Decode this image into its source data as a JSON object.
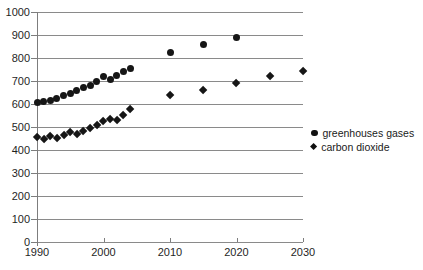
{
  "chart_data": {
    "type": "scatter",
    "title": "",
    "xlabel": "",
    "ylabel": "",
    "xlim": [
      1990,
      2030
    ],
    "ylim": [
      0,
      1000
    ],
    "grid": true,
    "legend_position": "right-middle",
    "x_ticks": [
      1990,
      2000,
      2010,
      2020,
      2030
    ],
    "y_ticks": [
      0,
      100,
      200,
      300,
      400,
      500,
      600,
      700,
      800,
      900,
      1000
    ],
    "series": [
      {
        "name": "greenhouses gases",
        "marker": "circle",
        "points": [
          [
            1990,
            605
          ],
          [
            1991,
            610
          ],
          [
            1992,
            617
          ],
          [
            1993,
            626
          ],
          [
            1994,
            636
          ],
          [
            1995,
            647
          ],
          [
            1996,
            658
          ],
          [
            1997,
            670
          ],
          [
            1998,
            682
          ],
          [
            1999,
            696
          ],
          [
            2000,
            718
          ],
          [
            2001,
            707
          ],
          [
            2002,
            726
          ],
          [
            2003,
            740
          ],
          [
            2004,
            753
          ],
          [
            2010,
            822
          ],
          [
            2015,
            858
          ],
          [
            2020,
            888
          ]
        ]
      },
      {
        "name": "carbon dioxide",
        "marker": "diamond",
        "points": [
          [
            1990,
            455
          ],
          [
            1991,
            448
          ],
          [
            1992,
            459
          ],
          [
            1993,
            453
          ],
          [
            1994,
            464
          ],
          [
            1995,
            477
          ],
          [
            1996,
            470
          ],
          [
            1997,
            484
          ],
          [
            1998,
            497
          ],
          [
            1999,
            510
          ],
          [
            2000,
            524
          ],
          [
            2001,
            536
          ],
          [
            2002,
            528
          ],
          [
            2003,
            552
          ],
          [
            2004,
            580
          ],
          [
            2010,
            640
          ],
          [
            2015,
            660
          ],
          [
            2020,
            690
          ],
          [
            2025,
            720
          ],
          [
            2030,
            743
          ]
        ]
      }
    ],
    "colors": {
      "marker": "#161616",
      "gridline": "#8a8a8a",
      "axis": "#7d7d7d",
      "tick_text": "#1f1f1f",
      "background": "#ffffff"
    }
  }
}
